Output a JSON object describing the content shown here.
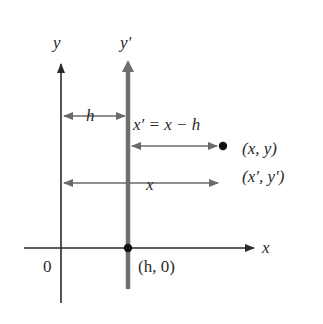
{
  "diagram": {
    "colors": {
      "axis": "#2a2a2a",
      "translated_axis": "#6e6e6e",
      "arrow": "#6a6a6a",
      "point": "#111111",
      "background": "#ffffff"
    },
    "labels": {
      "y_axis": "y",
      "y_prime_axis": "y′",
      "x_axis": "x",
      "origin": "0",
      "new_origin": "(h, 0)",
      "h_distance": "h",
      "equation": "x′ = x − h",
      "point_xy": "(x, y)",
      "point_xpyp": "(x′, y′)",
      "x_distance": "x"
    },
    "points": [
      {
        "name": "new-origin",
        "label": "(h, 0)"
      },
      {
        "name": "point",
        "label": "(x, y) / (x′, y′)"
      }
    ]
  }
}
